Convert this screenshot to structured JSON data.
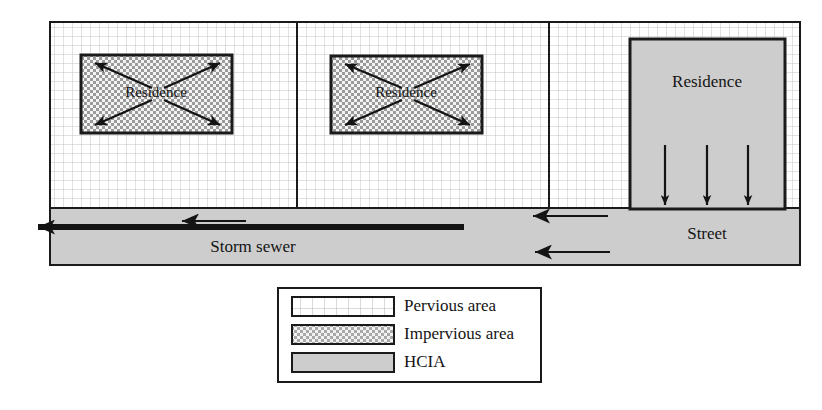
{
  "figure": {
    "type": "diagram",
    "lots": [
      {
        "id": "lot-1",
        "residence_label": "Residence",
        "surface": "impervious",
        "runoff_direction": "outward-diagonal",
        "arrow_count": 4
      },
      {
        "id": "lot-2",
        "residence_label": "Residence",
        "surface": "impervious",
        "runoff_direction": "outward-diagonal",
        "arrow_count": 4
      },
      {
        "id": "lot-3",
        "residence_label": "Residence",
        "surface": "hcia",
        "runoff_direction": "down-to-street",
        "arrow_count": 3
      }
    ],
    "street": {
      "label": "Street",
      "surface": "hcia",
      "inflow_arrow_count": 2,
      "flow_direction": "left"
    },
    "storm_sewer": {
      "label": "Storm sewer",
      "flow_direction": "left",
      "arrow_count": 2
    }
  },
  "labels": {
    "residence_1": "Residence",
    "residence_2": "Residence",
    "residence_3": "Residence",
    "street": "Street",
    "storm_sewer": "Storm sewer"
  },
  "legend": {
    "items": [
      {
        "key": "pervious",
        "label": "Pervious area",
        "swatch": "grid-pattern"
      },
      {
        "key": "impervious",
        "label": "Impervious area",
        "swatch": "checker-pattern"
      },
      {
        "key": "hcia",
        "label": "HCIA",
        "swatch": "solid-gray"
      }
    ]
  },
  "colors": {
    "stroke": "#1a1a1a",
    "pervious_fill": "#ffffff",
    "pervious_grid": "#b9b9b9",
    "impervious_fill": "#f2f2f2",
    "impervious_dot": "#8f8f8f",
    "hcia_fill": "#cdcdcd",
    "background": "#ffffff"
  }
}
